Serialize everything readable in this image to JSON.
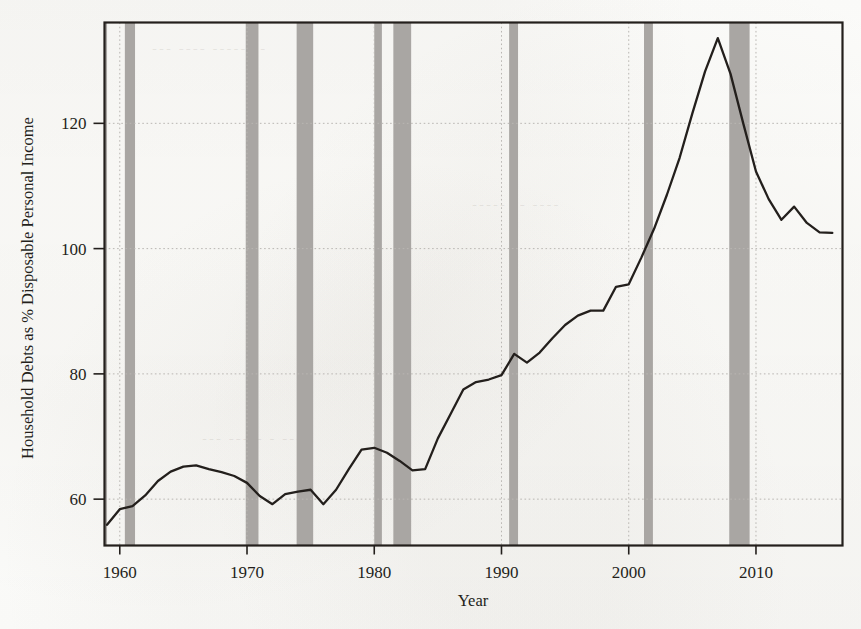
{
  "figure": {
    "kind": "line-chart",
    "background_color": "#fdfdfb",
    "ink_color": "#231f1c",
    "recession_band_color": "#a9a6a3",
    "grid_color": "#b9b6b2"
  },
  "axes": {
    "x_axis_label": "Year",
    "y_axis_label": "Household Debts as % Disposable Personal Income",
    "x_tick_labels": [
      "1960",
      "1970",
      "1980",
      "1990",
      "2000",
      "2010"
    ],
    "y_tick_labels": [
      "60",
      "80",
      "100",
      "120"
    ]
  },
  "chart_data": {
    "type": "line",
    "title": "",
    "xlabel": "Year",
    "ylabel": "Household Debts as % Disposable Personal Income",
    "xlim": [
      1958.8,
      2016.8
    ],
    "ylim": [
      52.6,
      136.1
    ],
    "xticks": [
      1960,
      1970,
      1980,
      1990,
      2000,
      2010
    ],
    "yticks": [
      60,
      80,
      100,
      120
    ],
    "grid": "dotted-both-axes",
    "legend": "none",
    "series": [
      {
        "name": "Household debt as % of disposable personal income",
        "x": [
          1959,
          1960,
          1961,
          1962,
          1963,
          1964,
          1965,
          1966,
          1967,
          1968,
          1969,
          1970,
          1971,
          1972,
          1973,
          1974,
          1975,
          1976,
          1977,
          1978,
          1979,
          1980,
          1981,
          1982,
          1983,
          1984,
          1985,
          1986,
          1987,
          1988,
          1989,
          1990,
          1991,
          1992,
          1993,
          1994,
          1995,
          1996,
          1997,
          1998,
          1999,
          2000,
          2001,
          2002,
          2003,
          2004,
          2005,
          2006,
          2007,
          2008,
          2009,
          2010,
          2011,
          2012,
          2013,
          2014,
          2015,
          2016
        ],
        "values": [
          55.9,
          58.4,
          58.9,
          60.6,
          62.9,
          64.4,
          65.2,
          65.4,
          64.8,
          64.3,
          63.7,
          62.6,
          60.5,
          59.2,
          60.8,
          61.2,
          61.5,
          59.2,
          61.5,
          64.8,
          67.9,
          68.2,
          67.4,
          66.1,
          64.6,
          64.8,
          69.7,
          73.6,
          77.5,
          78.7,
          79.1,
          79.8,
          83.2,
          81.8,
          83.4,
          85.7,
          87.8,
          89.3,
          90.1,
          90.1,
          93.9,
          94.3,
          98.6,
          103.2,
          108.6,
          114.5,
          121.6,
          128.3,
          133.6,
          127.9,
          120.0,
          112.3,
          107.9,
          104.6,
          106.7,
          104.1,
          102.6,
          102.5
        ]
      }
    ],
    "shaded_regions": {
      "label": "NBER recessions",
      "color": "#a9a6a3",
      "spans": [
        [
          1958.8,
          1959.0
        ],
        [
          1960.4,
          1961.2
        ],
        [
          1969.9,
          1970.9
        ],
        [
          1973.9,
          1975.2
        ],
        [
          1980.0,
          1980.6
        ],
        [
          1981.5,
          1982.9
        ],
        [
          1990.6,
          1991.3
        ],
        [
          2001.2,
          2001.9
        ],
        [
          2007.9,
          2009.5
        ]
      ]
    }
  }
}
